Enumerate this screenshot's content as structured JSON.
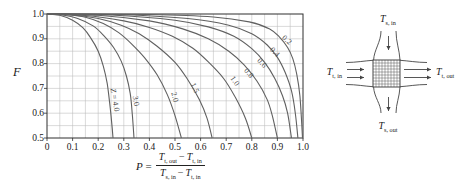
{
  "colors": {
    "curve": "#606060",
    "grid": "#bcbcbc",
    "frame": "#2f2f2f",
    "text": "#1a1a1a",
    "background": "#ffffff",
    "hatch": "#4a4a4a",
    "diagram_line": "#444444"
  },
  "chart_data": {
    "type": "line",
    "ylabel": "F",
    "xlabel_text": "P = (T_t,out − T_t,in) / (T_s,in − T_t,in)",
    "xlim": [
      0,
      1.0
    ],
    "ylim": [
      0.5,
      1.0
    ],
    "grid": "on",
    "minor_step": 0.05,
    "x_ticks": [
      "0",
      "0.1",
      "0.2",
      "0.3",
      "0.4",
      "0.5",
      "0.6",
      "0.7",
      "0.8",
      "0.9",
      "1.0"
    ],
    "y_ticks": [
      "1.0",
      "0.9",
      "0.8",
      "0.7",
      "0.6",
      "0.5"
    ],
    "series": [
      {
        "name": "Z = 4.0",
        "label_prefix_italic": "Z",
        "label": " = 4.0",
        "label_pos": [
          0.265,
          0.655
        ],
        "label_rot": 80,
        "points": [
          [
            0,
            1
          ],
          [
            0.05,
            0.995
          ],
          [
            0.1,
            0.975
          ],
          [
            0.14,
            0.945
          ],
          [
            0.17,
            0.905
          ],
          [
            0.2,
            0.85
          ],
          [
            0.22,
            0.79
          ],
          [
            0.235,
            0.72
          ],
          [
            0.245,
            0.64
          ],
          [
            0.252,
            0.57
          ],
          [
            0.258,
            0.5
          ]
        ]
      },
      {
        "name": "3.0",
        "label_prefix_italic": "",
        "label": "3.0",
        "label_pos": [
          0.348,
          0.65
        ],
        "label_rot": 80,
        "points": [
          [
            0,
            1
          ],
          [
            0.06,
            0.996
          ],
          [
            0.12,
            0.982
          ],
          [
            0.18,
            0.952
          ],
          [
            0.22,
            0.915
          ],
          [
            0.26,
            0.865
          ],
          [
            0.29,
            0.81
          ],
          [
            0.31,
            0.75
          ],
          [
            0.325,
            0.68
          ],
          [
            0.333,
            0.6
          ],
          [
            0.34,
            0.5
          ]
        ]
      },
      {
        "name": "2.0",
        "label_prefix_italic": "",
        "label": "2.0",
        "label_pos": [
          0.5,
          0.665
        ],
        "label_rot": 75,
        "points": [
          [
            0,
            1
          ],
          [
            0.08,
            0.997
          ],
          [
            0.15,
            0.987
          ],
          [
            0.22,
            0.962
          ],
          [
            0.28,
            0.925
          ],
          [
            0.33,
            0.88
          ],
          [
            0.38,
            0.825
          ],
          [
            0.43,
            0.755
          ],
          [
            0.47,
            0.675
          ],
          [
            0.5,
            0.59
          ],
          [
            0.525,
            0.5
          ]
        ]
      },
      {
        "name": "1.5",
        "label_prefix_italic": "",
        "label": "1.5",
        "label_pos": [
          0.578,
          0.7
        ],
        "label_rot": 65,
        "points": [
          [
            0,
            1
          ],
          [
            0.1,
            0.996
          ],
          [
            0.2,
            0.982
          ],
          [
            0.29,
            0.955
          ],
          [
            0.36,
            0.92
          ],
          [
            0.43,
            0.87
          ],
          [
            0.5,
            0.805
          ],
          [
            0.55,
            0.735
          ],
          [
            0.595,
            0.655
          ],
          [
            0.625,
            0.58
          ],
          [
            0.645,
            0.5
          ]
        ]
      },
      {
        "name": "1.0",
        "label_prefix_italic": "",
        "label": "1.0",
        "label_pos": [
          0.733,
          0.728
        ],
        "label_rot": 55,
        "points": [
          [
            0,
            1
          ],
          [
            0.15,
            0.994
          ],
          [
            0.3,
            0.972
          ],
          [
            0.4,
            0.946
          ],
          [
            0.49,
            0.91
          ],
          [
            0.57,
            0.862
          ],
          [
            0.63,
            0.807
          ],
          [
            0.69,
            0.74
          ],
          [
            0.735,
            0.665
          ],
          [
            0.775,
            0.58
          ],
          [
            0.8,
            0.5
          ]
        ]
      },
      {
        "name": "0.8",
        "label_prefix_italic": "",
        "label": "0.8",
        "label_pos": [
          0.788,
          0.763
        ],
        "label_rot": 50,
        "points": [
          [
            0,
            1
          ],
          [
            0.2,
            0.995
          ],
          [
            0.4,
            0.972
          ],
          [
            0.53,
            0.94
          ],
          [
            0.63,
            0.9
          ],
          [
            0.71,
            0.85
          ],
          [
            0.77,
            0.795
          ],
          [
            0.82,
            0.73
          ],
          [
            0.86,
            0.655
          ],
          [
            0.88,
            0.59
          ],
          [
            0.9,
            0.5
          ]
        ]
      },
      {
        "name": "0.6",
        "label_prefix_italic": "",
        "label": "0.6",
        "label_pos": [
          0.838,
          0.803
        ],
        "label_rot": 47,
        "points": [
          [
            0,
            1
          ],
          [
            0.25,
            0.996
          ],
          [
            0.5,
            0.975
          ],
          [
            0.63,
            0.948
          ],
          [
            0.73,
            0.91
          ],
          [
            0.8,
            0.86
          ],
          [
            0.85,
            0.805
          ],
          [
            0.89,
            0.74
          ],
          [
            0.92,
            0.67
          ],
          [
            0.94,
            0.6
          ],
          [
            0.955,
            0.5
          ]
        ]
      },
      {
        "name": "0.4",
        "label_prefix_italic": "",
        "label": "0.4",
        "label_pos": [
          0.889,
          0.847
        ],
        "label_rot": 44,
        "points": [
          [
            0,
            1
          ],
          [
            0.3,
            0.997
          ],
          [
            0.55,
            0.982
          ],
          [
            0.71,
            0.955
          ],
          [
            0.8,
            0.92
          ],
          [
            0.86,
            0.875
          ],
          [
            0.9,
            0.825
          ],
          [
            0.93,
            0.765
          ],
          [
            0.955,
            0.69
          ],
          [
            0.97,
            0.6
          ],
          [
            0.98,
            0.5
          ]
        ]
      },
      {
        "name": "0.2",
        "label_prefix_italic": "",
        "label": "0.2",
        "label_pos": [
          0.938,
          0.896
        ],
        "label_rot": 40,
        "points": [
          [
            0,
            1
          ],
          [
            0.4,
            0.998
          ],
          [
            0.65,
            0.988
          ],
          [
            0.79,
            0.968
          ],
          [
            0.87,
            0.94
          ],
          [
            0.91,
            0.905
          ],
          [
            0.94,
            0.865
          ],
          [
            0.96,
            0.82
          ],
          [
            0.975,
            0.76
          ],
          [
            0.988,
            0.67
          ],
          [
            0.998,
            0.5
          ]
        ]
      }
    ]
  },
  "formula": {
    "lhs": "P",
    "eq": "=",
    "num": {
      "a": "T",
      "a_sub": "t, out",
      "op": "−",
      "b": "T",
      "b_sub": "t, in"
    },
    "den": {
      "a": "T",
      "a_sub": "s, in",
      "op": "−",
      "b": "T",
      "b_sub": "t, in"
    }
  },
  "diagram": {
    "top": {
      "base": "T",
      "sub": "s, in"
    },
    "left": {
      "base": "T",
      "sub": "t, in"
    },
    "right": {
      "base": "T",
      "sub": "t, out"
    },
    "bottom": {
      "base": "T",
      "sub": "s, out"
    }
  }
}
